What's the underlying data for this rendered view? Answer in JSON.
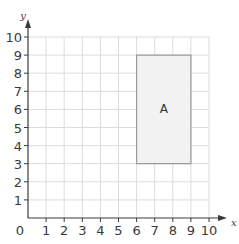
{
  "chart_data": {
    "type": "scatter",
    "title": "",
    "xlabel": "x",
    "ylabel": "y",
    "xlim": [
      0,
      10
    ],
    "ylim": [
      0,
      10
    ],
    "grid": true,
    "x_ticks": [
      "1",
      "2",
      "3",
      "4",
      "5",
      "6",
      "7",
      "8",
      "9",
      "10"
    ],
    "y_ticks": [
      "1",
      "2",
      "3",
      "4",
      "5",
      "6",
      "7",
      "8",
      "9",
      "10"
    ],
    "origin_label": "0",
    "shapes": [
      {
        "name": "A",
        "type": "rectangle",
        "vertices": [
          [
            6,
            3
          ],
          [
            9,
            3
          ],
          [
            9,
            9
          ],
          [
            6,
            9
          ]
        ],
        "fill": "#f2f2f2",
        "stroke": "#9a9a9a"
      }
    ]
  },
  "colors": {
    "grid": "#dcdcdc",
    "axis": "#3a3a3a",
    "shape_fill": "#f2f2f2",
    "shape_stroke": "#9a9a9a"
  }
}
